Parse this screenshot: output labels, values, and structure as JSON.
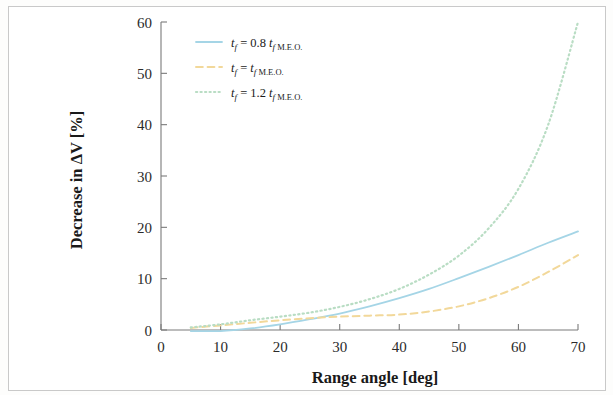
{
  "figure": {
    "background_color": "#ffffff",
    "frame_color": "#c9c9c9"
  },
  "chart_data": {
    "type": "line",
    "title": "",
    "subtitle": "",
    "xlabel": "Range angle [deg]",
    "ylabel": "Decrease in ΔV [%]",
    "xlim": [
      0,
      70
    ],
    "ylim": [
      0,
      60
    ],
    "xticks": [
      0,
      10,
      20,
      30,
      40,
      50,
      60,
      70
    ],
    "yticks": [
      0,
      10,
      20,
      30,
      40,
      50,
      60
    ],
    "xticklabels": [
      "0",
      "10",
      "20",
      "30",
      "40",
      "50",
      "60",
      "70"
    ],
    "yticklabels": [
      "0",
      "10",
      "20",
      "30",
      "40",
      "50",
      "60"
    ],
    "grid": false,
    "legend_position": "upper-left",
    "x": [
      5,
      10,
      15,
      20,
      25,
      30,
      35,
      40,
      45,
      50,
      55,
      60,
      65,
      70
    ],
    "series": [
      {
        "name": "t_f = 0.8 t_f M.E.O.",
        "label_parts": {
          "var": "t",
          "sub": "f",
          "eq": "=",
          "coef": "0.8",
          "var2": "t",
          "sub2": "f",
          "sub3": "M.E.O."
        },
        "color": "#a5d5e6",
        "style": "solid",
        "width": 1.8,
        "values": [
          -0.2,
          -0.2,
          0.3,
          1.1,
          2.1,
          3.2,
          4.6,
          6.2,
          8.0,
          10.1,
          12.3,
          14.6,
          17.0,
          19.2
        ]
      },
      {
        "name": "t_f = t_f M.E.O.",
        "label_parts": {
          "var": "t",
          "sub": "f",
          "eq": "=",
          "coef": "",
          "var2": "t",
          "sub2": "f",
          "sub3": "M.E.O."
        },
        "color": "#f2d89a",
        "style": "dashed",
        "width": 2.0,
        "values": [
          0.4,
          0.9,
          1.4,
          1.9,
          2.3,
          2.6,
          2.8,
          3.0,
          3.6,
          4.6,
          6.2,
          8.4,
          11.3,
          14.6
        ]
      },
      {
        "name": "t_f = 1.2 t_f M.E.O.",
        "label_parts": {
          "var": "t",
          "sub": "f",
          "eq": "=",
          "coef": "1.2",
          "var2": "t",
          "sub2": "f",
          "sub3": "M.E.O."
        },
        "color": "#b9ddc4",
        "style": "dotted",
        "width": 2.2,
        "values": [
          0.5,
          1.1,
          1.9,
          2.6,
          3.4,
          4.5,
          6.0,
          8.0,
          10.8,
          14.5,
          19.8,
          27.5,
          40.0,
          60.0
        ]
      }
    ]
  },
  "legend": {
    "entries": [
      {
        "text": "tƒ = 0.8 tƒ M.E.O.",
        "color": "#a5d5e6",
        "style": "solid"
      },
      {
        "text": "tƒ = tƒ M.E.O.",
        "color": "#f2d89a",
        "style": "dashed"
      },
      {
        "text": "tƒ = 1.2 tƒ M.E.O.",
        "color": "#b9ddc4",
        "style": "dotted"
      }
    ]
  }
}
